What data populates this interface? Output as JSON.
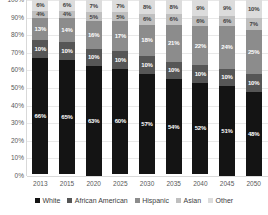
{
  "chart_data": {
    "type": "bar",
    "stacked": true,
    "orientation": "vertical",
    "title": "",
    "subtitle": "",
    "xlabel": "",
    "ylabel": "",
    "ylim": [
      0,
      100
    ],
    "y_unit": "%",
    "grid": true,
    "legend_position": "bottom",
    "categories": [
      "2013",
      "2015",
      "2020",
      "2025",
      "2030",
      "2035",
      "2040",
      "2045",
      "2050"
    ],
    "y_ticks": [
      "0%",
      "10%",
      "20%",
      "30%",
      "40%",
      "50%",
      "60%",
      "70%",
      "80%",
      "90%",
      "100%"
    ],
    "y_tick_values": [
      0,
      10,
      20,
      30,
      40,
      50,
      60,
      70,
      80,
      90,
      100
    ],
    "series": [
      {
        "name": "White",
        "color": "#141414",
        "label_color": "light",
        "values": [
          66,
          65,
          63,
          60,
          57,
          54,
          52,
          51,
          48
        ],
        "labels": [
          "66%",
          "65%",
          "63%",
          "60%",
          "57%",
          "54%",
          "52%",
          "51%",
          "48%"
        ]
      },
      {
        "name": "African American",
        "color": "#565656",
        "label_color": "light",
        "values": [
          10,
          10,
          10,
          10,
          10,
          10,
          10,
          10,
          10
        ],
        "labels": [
          "10%",
          "10%",
          "10%",
          "10%",
          "10%",
          "10%",
          "10%",
          "10%",
          "10%"
        ]
      },
      {
        "name": "Hispanic",
        "color": "#8c8c8c",
        "label_color": "light",
        "values": [
          13,
          14,
          16,
          17,
          18,
          21,
          22,
          24,
          25
        ],
        "labels": [
          "13%",
          "14%",
          "16%",
          "17%",
          "18%",
          "21%",
          "22%",
          "24%",
          "25%"
        ]
      },
      {
        "name": "Asian",
        "color": "#bfbfbf",
        "label_color": "dark",
        "values": [
          4,
          4,
          5,
          5,
          6,
          6,
          6,
          6,
          7
        ],
        "labels": [
          "4%",
          "4%",
          "5%",
          "5%",
          "6%",
          "6%",
          "6%",
          "6%",
          "7%"
        ]
      },
      {
        "name": "Other",
        "color": "#dcdcdc",
        "label_color": "dark",
        "values": [
          6,
          6,
          7,
          7,
          8,
          8,
          9,
          9,
          10
        ],
        "labels": [
          "6%",
          "6%",
          "7%",
          "7%",
          "8%",
          "8%",
          "9%",
          "9%",
          "10%"
        ]
      }
    ]
  },
  "legend": {
    "items": [
      {
        "label": "White",
        "color": "#141414"
      },
      {
        "label": "African American",
        "color": "#565656"
      },
      {
        "label": "Hispanic",
        "color": "#8c8c8c"
      },
      {
        "label": "Asian",
        "color": "#bfbfbf"
      },
      {
        "label": "Other",
        "color": "#dcdcdc"
      }
    ]
  }
}
